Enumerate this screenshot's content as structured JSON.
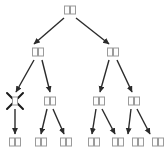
{
  "diagram": {
    "type": "tree",
    "title": "",
    "glyph_note": "unrendered-cjk-tofu",
    "node_glyph": "□",
    "colors": {
      "background": "#ffffff",
      "arrow": "#2b2b2b",
      "node_box_border": "#9a9a9a",
      "node_box_fill": "#fdfdfd",
      "cross_mark": "#1a1a1a"
    },
    "levels": [
      {
        "level": 0,
        "nodes": [
          {
            "id": "n0",
            "label": "□□",
            "chars": 2,
            "x": 70,
            "y": 10,
            "crossed": false
          }
        ]
      },
      {
        "level": 1,
        "nodes": [
          {
            "id": "n1",
            "label": "□□",
            "chars": 2,
            "x": 38,
            "y": 52,
            "crossed": false
          },
          {
            "id": "n2",
            "label": "□□",
            "chars": 2,
            "x": 113,
            "y": 52,
            "crossed": false
          }
        ]
      },
      {
        "level": 2,
        "nodes": [
          {
            "id": "n3",
            "label": "□",
            "chars": 1,
            "x": 15,
            "y": 101,
            "crossed": true
          },
          {
            "id": "n4",
            "label": "□□",
            "chars": 2,
            "x": 50,
            "y": 101,
            "crossed": false
          },
          {
            "id": "n5",
            "label": "□□",
            "chars": 2,
            "x": 99,
            "y": 101,
            "crossed": false
          },
          {
            "id": "n6",
            "label": "□□",
            "chars": 2,
            "x": 134,
            "y": 101,
            "crossed": false
          }
        ]
      },
      {
        "level": 3,
        "nodes": [
          {
            "id": "n7",
            "label": "□□",
            "chars": 2,
            "x": 15,
            "y": 142,
            "crossed": false
          },
          {
            "id": "n8",
            "label": "□□",
            "chars": 2,
            "x": 41,
            "y": 142,
            "crossed": false
          },
          {
            "id": "n9",
            "label": "□□",
            "chars": 2,
            "x": 66,
            "y": 142,
            "crossed": false
          },
          {
            "id": "n10",
            "label": "□□",
            "chars": 2,
            "x": 94,
            "y": 142,
            "crossed": false
          },
          {
            "id": "n11",
            "label": "□□",
            "chars": 2,
            "x": 118,
            "y": 142,
            "crossed": false
          },
          {
            "id": "n12",
            "label": "□□",
            "chars": 2,
            "x": 138,
            "y": 142,
            "crossed": false
          },
          {
            "id": "n13",
            "label": "□□",
            "chars": 2,
            "x": 158,
            "y": 142,
            "crossed": false
          }
        ]
      }
    ],
    "edges": [
      {
        "from": "n0",
        "to": "n1",
        "x1": 64,
        "y1": 18,
        "x2": 34,
        "y2": 44
      },
      {
        "from": "n0",
        "to": "n2",
        "x1": 76,
        "y1": 18,
        "x2": 109,
        "y2": 44
      },
      {
        "from": "n1",
        "to": "n3",
        "x1": 34,
        "y1": 60,
        "x2": 16,
        "y2": 92
      },
      {
        "from": "n1",
        "to": "n4",
        "x1": 42,
        "y1": 60,
        "x2": 50,
        "y2": 92
      },
      {
        "from": "n2",
        "to": "n5",
        "x1": 109,
        "y1": 60,
        "x2": 100,
        "y2": 92
      },
      {
        "from": "n2",
        "to": "n6",
        "x1": 117,
        "y1": 60,
        "x2": 132,
        "y2": 92
      },
      {
        "from": "n3",
        "to": "n7",
        "x1": 15,
        "y1": 109,
        "x2": 15,
        "y2": 134
      },
      {
        "from": "n4",
        "to": "n8",
        "x1": 47,
        "y1": 109,
        "x2": 41,
        "y2": 134
      },
      {
        "from": "n4",
        "to": "n9",
        "x1": 53,
        "y1": 109,
        "x2": 64,
        "y2": 134
      },
      {
        "from": "n5",
        "to": "n10",
        "x1": 96,
        "y1": 109,
        "x2": 92,
        "y2": 134
      },
      {
        "from": "n5",
        "to": "n11",
        "x1": 102,
        "y1": 109,
        "x2": 115,
        "y2": 134
      },
      {
        "from": "n6",
        "to": "n12",
        "x1": 131,
        "y1": 109,
        "x2": 128,
        "y2": 134
      },
      {
        "from": "n6",
        "to": "n13",
        "x1": 137,
        "y1": 109,
        "x2": 150,
        "y2": 134
      }
    ],
    "cross_marks": [
      {
        "node": "n3",
        "x": 15,
        "y": 101,
        "size": 16
      }
    ]
  }
}
